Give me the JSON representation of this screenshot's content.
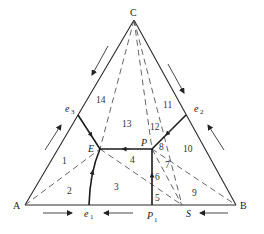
{
  "figure": {
    "type": "ternary phase diagram with incongruent compound S",
    "vertices": {
      "A": {
        "label": "A",
        "x": 25,
        "y": 205
      },
      "B": {
        "label": "B",
        "x": 236,
        "y": 205
      },
      "C": {
        "label": "C",
        "x": 134,
        "y": 20
      }
    },
    "points": {
      "E": {
        "label": "E",
        "x": 100,
        "y": 149
      },
      "P": {
        "label": "P",
        "x": 152,
        "y": 149
      },
      "P1": {
        "label": "P",
        "sub": "1",
        "x": 152,
        "y": 205
      },
      "S": {
        "label": "S",
        "x": 182,
        "y": 205
      },
      "e1": {
        "label": "e",
        "sub": "1",
        "x": 89,
        "y": 205
      },
      "e2": {
        "label": "e",
        "sub": "2",
        "x": 186,
        "y": 115
      },
      "e3": {
        "label": "e",
        "sub": "3",
        "x": 78,
        "y": 115
      }
    },
    "regions": [
      "1",
      "2",
      "3",
      "4",
      "5",
      "6",
      "7",
      "8",
      "9",
      "10",
      "11",
      "12",
      "13",
      "14"
    ],
    "boundary_curves": [
      "e3-E",
      "e1-E",
      "P1-P",
      "e2-P",
      "P-E"
    ],
    "connection_lines_dashed": [
      "A-E",
      "E-S",
      "C-E",
      "C-P1",
      "C-S",
      "P-S",
      "P-B"
    ],
    "temperature_arrows": [
      "along CA toward A",
      "along AB toward e1 from A",
      "along AB toward e1 from P1",
      "along BA toward S from B",
      "along BC toward C",
      "along CB toward B"
    ]
  }
}
